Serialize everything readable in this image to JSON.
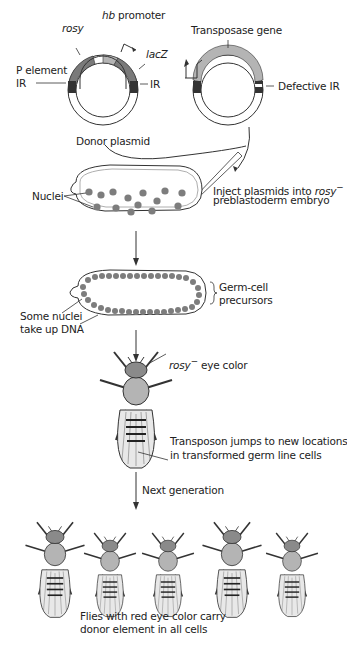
{
  "donor_plasmid": {
    "label": "Donor plasmid",
    "segments": [
      "rosy",
      "hb",
      "promoter",
      "lacZ",
      "P element",
      "IR",
      "IR"
    ]
  },
  "helper_plasmid": {
    "segments": [
      "Transposase gene",
      "Defective IR"
    ]
  },
  "steps": {
    "inject": [
      "Inject plasmids into ",
      "rosy",
      "−",
      "preblastoderm embryo"
    ],
    "nuclei": "Nuclei",
    "germ": [
      "Germ-cell",
      "precursors"
    ],
    "uptake": [
      "Some nuclei",
      "take up DNA"
    ],
    "eye": [
      "rosy",
      "−",
      " eye color"
    ],
    "transposon": [
      "Transposon jumps to new locations",
      "in transformed germ line cells"
    ],
    "next_gen": "Next generation",
    "result": [
      "Flies with red eye color carry",
      "donor element in all cells"
    ]
  },
  "colors": {
    "dark_gray": "#3a3a3a",
    "mid_gray": "#7a7a7a",
    "light_gray": "#b4b4b4",
    "nucleus": "#7d7d7d",
    "line": "#333333"
  }
}
